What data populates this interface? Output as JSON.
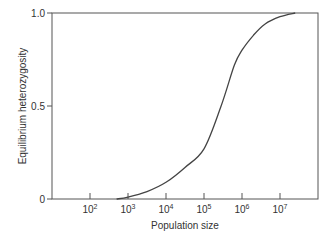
{
  "chart_data": {
    "type": "line",
    "title": "",
    "xlabel": "Population size",
    "ylabel": "Equilibrium heterozygosity",
    "x_scale": "log",
    "x_tick_labels": [
      "10^2",
      "10^3",
      "10^4",
      "10^5",
      "10^6",
      "10^7"
    ],
    "y_tick_labels": [
      "0",
      "0.5",
      "1.0"
    ],
    "ylim": [
      0,
      1.0
    ],
    "xlim_log10": [
      1.0,
      8.0
    ],
    "grid": false,
    "legend": null,
    "series": [
      {
        "name": "Equilibrium heterozygosity",
        "x_log10": [
          2.7,
          3.0,
          3.5,
          4.0,
          4.5,
          5.0,
          5.45,
          5.8,
          6.0,
          6.3,
          6.6,
          7.0,
          7.4
        ],
        "values": [
          0.0,
          0.01,
          0.04,
          0.09,
          0.17,
          0.27,
          0.5,
          0.72,
          0.8,
          0.88,
          0.94,
          0.98,
          1.0
        ]
      }
    ]
  },
  "axes": {
    "x_label": "Population size",
    "y_label": "Equilibrium heterozygosity",
    "x_ticks": [
      {
        "base": "10",
        "exp": "2"
      },
      {
        "base": "10",
        "exp": "3"
      },
      {
        "base": "10",
        "exp": "4"
      },
      {
        "base": "10",
        "exp": "5"
      },
      {
        "base": "10",
        "exp": "6"
      },
      {
        "base": "10",
        "exp": "7"
      }
    ],
    "y_ticks": [
      "0",
      "0.5",
      "1.0"
    ]
  }
}
